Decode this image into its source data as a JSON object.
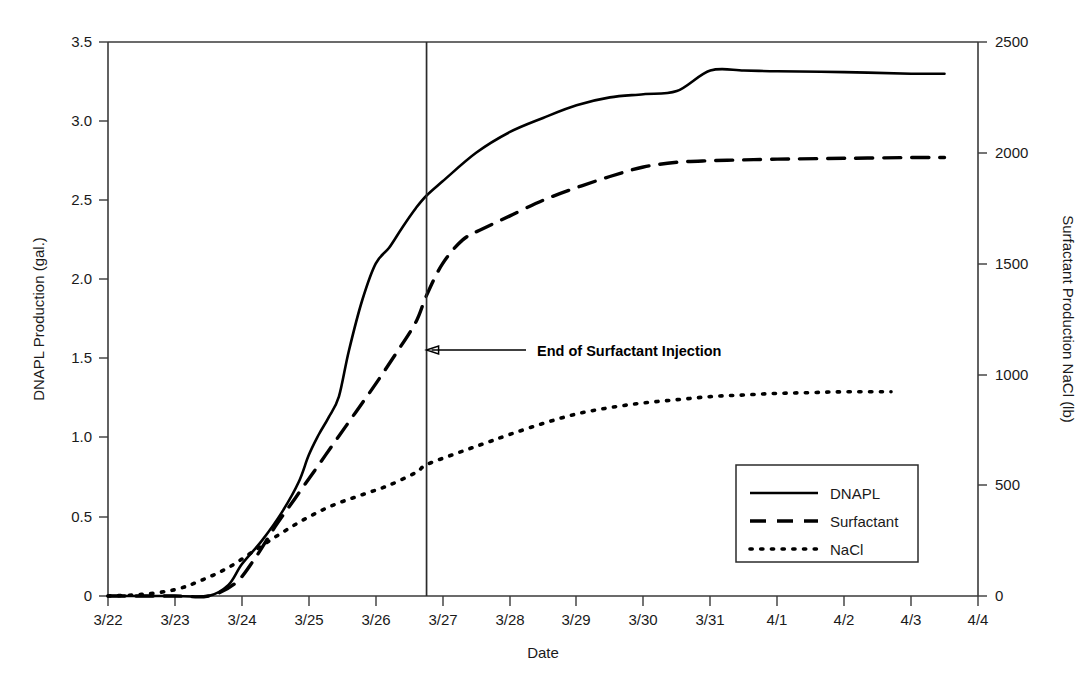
{
  "chart_data": {
    "type": "line",
    "title": "",
    "xlabel": "Date",
    "ylabel": "DNAPL Production (gal.)",
    "y2label": "Surfactant Production NaCl (lb)",
    "xlim": [
      "3/22",
      "4/4"
    ],
    "ylim": [
      0,
      3.5
    ],
    "y2lim": [
      0,
      2500
    ],
    "grid": false,
    "legend_position": "lower-right",
    "x_ticks": [
      "3/22",
      "3/23",
      "3/24",
      "3/25",
      "3/26",
      "3/27",
      "3/28",
      "3/29",
      "3/30",
      "3/31",
      "4/1",
      "4/2",
      "4/3",
      "4/4"
    ],
    "y_ticks": [
      "0",
      "0.5",
      "1.0",
      "1.5",
      "2.0",
      "2.5",
      "3.0",
      "3.5"
    ],
    "y_tick_values": [
      0,
      0.5,
      1.0,
      1.5,
      2.0,
      2.5,
      3.0,
      3.5
    ],
    "y2_ticks": [
      "0",
      "500",
      "1000",
      "1500",
      "2000",
      "2500"
    ],
    "y2_tick_values": [
      0,
      500,
      1000,
      1500,
      2000,
      2500
    ],
    "series": [
      {
        "name": "DNAPL",
        "style": "solid",
        "axis": "left",
        "unit": "gal.",
        "x": [
          "3/22",
          "3/23",
          "3/23.5",
          "3/23.8",
          "3/24.0",
          "3/24.3",
          "3/24.6",
          "3/24.85",
          "3/25.0",
          "3/25.15",
          "3/25.3",
          "3/25.45",
          "3/25.6",
          "3/25.8",
          "3/26.0",
          "3/26.2",
          "3/26.4",
          "3/26.6",
          "3/26.76",
          "3/27.0",
          "3/27.5",
          "3/28.0",
          "3/28.5",
          "3/29.0",
          "3/29.5",
          "3/30.0",
          "3/30.5",
          "3/31.0",
          "3/31.5",
          "4/1",
          "4/2",
          "4/3",
          "4/3.5"
        ],
        "y": [
          0,
          0,
          0.0,
          0.07,
          0.2,
          0.35,
          0.53,
          0.72,
          0.89,
          1.02,
          1.13,
          1.26,
          1.55,
          1.87,
          2.1,
          2.2,
          2.33,
          2.45,
          2.53,
          2.62,
          2.8,
          2.93,
          3.02,
          3.1,
          3.15,
          3.17,
          3.19,
          3.32,
          3.32,
          3.315,
          3.31,
          3.3,
          3.3
        ]
      },
      {
        "name": "Surfactant",
        "style": "dashed",
        "axis": "right",
        "unit": "lb",
        "x": [
          "3/22",
          "3/23",
          "3/23.5",
          "3/23.9",
          "3/24.2",
          "3/24.5",
          "3/24.8",
          "3/25.1",
          "3/25.4",
          "3/25.7",
          "3/26.0",
          "3/26.3",
          "3/26.6",
          "3/26.76",
          "3/27.0",
          "3/27.3",
          "3/27.6",
          "3/28.0",
          "3/28.5",
          "3/29.0",
          "3/29.5",
          "3/30.0",
          "3/30.5",
          "3/31.0",
          "3/31.5",
          "4/1",
          "4/2",
          "4/3",
          "4/3.5"
        ],
        "y_left_equiv": [
          0,
          0,
          0.0,
          0.08,
          0.24,
          0.44,
          0.62,
          0.8,
          0.98,
          1.16,
          1.34,
          1.53,
          1.73,
          1.9,
          2.1,
          2.25,
          2.32,
          2.4,
          2.5,
          2.58,
          2.65,
          2.71,
          2.74,
          2.75,
          2.755,
          2.76,
          2.765,
          2.77,
          2.77
        ],
        "y": [
          0,
          0,
          0,
          57,
          171,
          314,
          443,
          571,
          700,
          829,
          957,
          1093,
          1236,
          1357,
          1500,
          1607,
          1657,
          1714,
          1786,
          1843,
          1893,
          1936,
          1957,
          1964,
          1968,
          1971,
          1975,
          1979,
          1979
        ]
      },
      {
        "name": "NaCl",
        "style": "dotted",
        "axis": "right",
        "unit": "lb",
        "x": [
          "3/22",
          "3/22.5",
          "3/23.0",
          "3/23.4",
          "3/23.8",
          "3/24.2",
          "3/24.6",
          "3/25.0",
          "3/25.4",
          "3/25.8",
          "3/26.2",
          "3/26.6",
          "3/26.76",
          "3/27.2",
          "3/27.6",
          "3/28.0",
          "3/28.5",
          "3/29.0",
          "3/29.5",
          "3/30.0",
          "3/30.5",
          "3/31.0",
          "3/31.5",
          "4/1",
          "4/1.5",
          "4/2",
          "4/2.7"
        ],
        "y_left_equiv": [
          0,
          0.01,
          0.04,
          0.1,
          0.18,
          0.29,
          0.4,
          0.5,
          0.58,
          0.64,
          0.7,
          0.78,
          0.83,
          0.9,
          0.96,
          1.02,
          1.09,
          1.15,
          1.19,
          1.22,
          1.24,
          1.26,
          1.27,
          1.28,
          1.285,
          1.29,
          1.29
        ],
        "y": [
          0,
          7,
          29,
          71,
          129,
          207,
          286,
          357,
          414,
          457,
          500,
          557,
          593,
          643,
          686,
          729,
          779,
          821,
          850,
          871,
          886,
          900,
          907,
          914,
          918,
          921,
          921
        ]
      }
    ],
    "annotations": [
      {
        "name": "end-of-surfactant-injection",
        "text": "End of Surfactant Injection",
        "marker": "vertical-line",
        "x": "3/26.76",
        "arrow": "left"
      }
    ]
  },
  "axes": {
    "left_title": "DNAPL Production (gal.)",
    "right_title": "Surfactant Production NaCl (lb)",
    "x_title": "Date"
  },
  "legend": {
    "items": [
      {
        "label": "DNAPL",
        "style": "solid"
      },
      {
        "label": "Surfactant",
        "style": "dashed"
      },
      {
        "label": "NaCl",
        "style": "dotted"
      }
    ]
  },
  "annotation": {
    "label": "End of Surfactant Injection"
  },
  "colors": {
    "ink": "#000000",
    "axis": "#3a3a3a",
    "background": "#ffffff"
  }
}
